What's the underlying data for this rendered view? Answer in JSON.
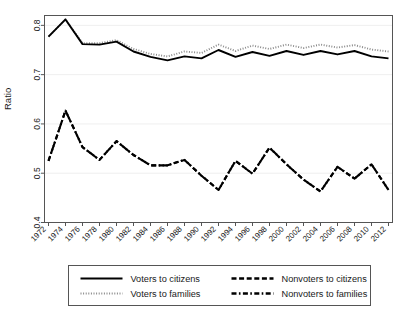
{
  "figure": {
    "ylabel": "Ratio",
    "xlabel": "",
    "title": ""
  },
  "axes": {
    "y_ticks": [
      "0.4",
      "0.5",
      "0.6",
      "0.7",
      "0.8"
    ],
    "y_tick_values": [
      0.4,
      0.5,
      0.6,
      0.7,
      0.8
    ],
    "x_ticks": [
      "1972",
      "1974",
      "1976",
      "1978",
      "1980",
      "1982",
      "1984",
      "1986",
      "1988",
      "1990",
      "1992",
      "1994",
      "1996",
      "1998",
      "2000",
      "2002",
      "2004",
      "2006",
      "2008",
      "2010",
      "2012"
    ]
  },
  "legend": {
    "items": [
      {
        "label": "Voters to citizens",
        "style": "solid",
        "color": "#000000"
      },
      {
        "label": "Nonvoters to citizens",
        "style": "dashed",
        "color": "#000000"
      },
      {
        "label": "Voters to families",
        "style": "dotted",
        "color": "#8a8a8a"
      },
      {
        "label": "Nonvoters to families",
        "style": "dashdotted",
        "color": "#000000"
      }
    ]
  },
  "chart_data": {
    "type": "line",
    "title": "",
    "xlabel": "",
    "ylabel": "Ratio",
    "xlim": [
      1972,
      2012
    ],
    "ylim": [
      0.4,
      0.82
    ],
    "grid": true,
    "legend_position": "below",
    "x": [
      1972,
      1974,
      1976,
      1978,
      1980,
      1982,
      1984,
      1986,
      1988,
      1990,
      1992,
      1994,
      1996,
      1998,
      2000,
      2002,
      2004,
      2006,
      2008,
      2010,
      2012
    ],
    "series": [
      {
        "name": "Voters to citizens",
        "style": "solid",
        "color": "#000000",
        "values": [
          0.777,
          0.812,
          0.762,
          0.761,
          0.767,
          0.747,
          0.736,
          0.729,
          0.737,
          0.733,
          0.75,
          0.736,
          0.746,
          0.738,
          0.748,
          0.74,
          0.748,
          0.741,
          0.748,
          0.737,
          0.733
        ]
      },
      {
        "name": "Voters to families",
        "style": "dotted",
        "color": "#8a8a8a",
        "values": [
          0.777,
          0.812,
          0.764,
          0.764,
          0.77,
          0.752,
          0.742,
          0.737,
          0.747,
          0.744,
          0.761,
          0.748,
          0.759,
          0.752,
          0.761,
          0.754,
          0.761,
          0.755,
          0.76,
          0.751,
          0.747
        ]
      },
      {
        "name": "Nonvoters to citizens",
        "style": "dashed",
        "color": "#000000",
        "values": [
          0.525,
          0.627,
          0.553,
          0.527,
          0.565,
          0.537,
          0.516,
          0.516,
          0.527,
          0.495,
          0.466,
          0.525,
          0.499,
          0.552,
          0.518,
          0.487,
          0.463,
          0.513,
          0.489,
          0.518,
          0.466
        ]
      },
      {
        "name": "Nonvoters to families",
        "style": "dashdotted",
        "color": "#000000",
        "values": [
          0.525,
          0.627,
          0.553,
          0.527,
          0.565,
          0.537,
          0.516,
          0.516,
          0.527,
          0.495,
          0.466,
          0.525,
          0.499,
          0.552,
          0.518,
          0.487,
          0.463,
          0.513,
          0.489,
          0.518,
          0.466
        ]
      }
    ]
  }
}
